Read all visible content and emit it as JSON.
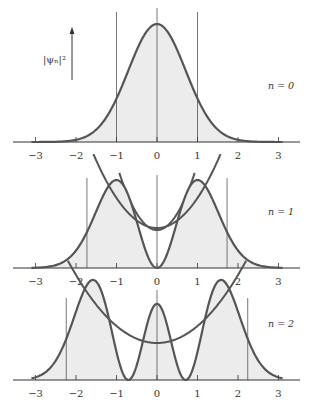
{
  "chart_data": [
    {
      "type": "line",
      "title": "",
      "ylabel": "|ψₙ|²",
      "xlabel": "",
      "xlim": [
        -3.4,
        3.6
      ],
      "x_ticks": [
        -3,
        -2,
        -1,
        0,
        1,
        2,
        3
      ],
      "x_tick_labels": [
        "−3",
        "−2",
        "−1",
        "0",
        "1",
        "2",
        "3"
      ],
      "panels": [
        {
          "n": 0,
          "label": "n = 0",
          "series": [
            {
              "name": "probability density |ψ0|²",
              "function": "exp(-x^2)",
              "peak_positions": [
                0
              ],
              "shaded": true
            },
            {
              "name": "potential",
              "function": "parabola x^2",
              "shape": "U"
            }
          ],
          "classical_turning_points": [
            -1,
            1
          ]
        },
        {
          "n": 1,
          "label": "n = 1",
          "series": [
            {
              "name": "probability density |ψ1|²",
              "function": "x^2 exp(-x^2)",
              "peak_positions": [
                -1,
                1
              ],
              "node_positions": [
                0
              ],
              "shaded": true
            },
            {
              "name": "potential",
              "function": "parabola x^2",
              "shape": "U"
            }
          ],
          "classical_turning_points": [
            -1.73,
            1.73
          ]
        },
        {
          "n": 2,
          "label": "n = 2",
          "series": [
            {
              "name": "probability density |ψ2|²",
              "function": "(2x^2-1)^2 exp(-x^2)",
              "peak_positions": [
                -1.73,
                0,
                1.73
              ],
              "node_positions": [
                -0.71,
                0.71
              ],
              "shaded": true
            },
            {
              "name": "potential",
              "function": "parabola x^2",
              "shape": "U"
            }
          ],
          "classical_turning_points": [
            -2.24,
            2.24
          ]
        }
      ]
    }
  ],
  "colors": {
    "curve": "#555555",
    "shade": "#ececec",
    "axis": "#333333",
    "turning_line": "#555555"
  }
}
